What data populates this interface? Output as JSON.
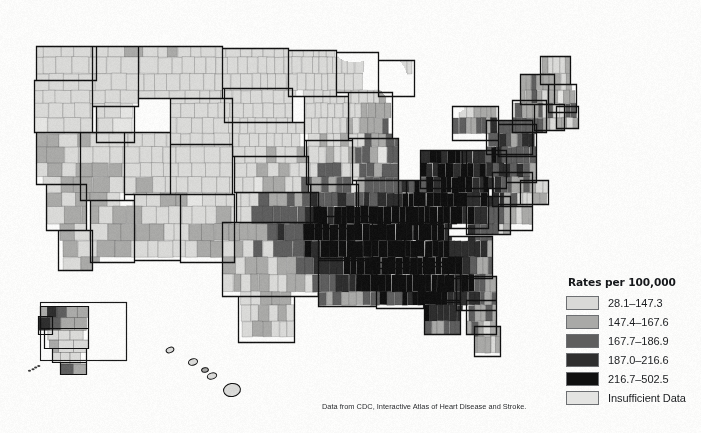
{
  "page": {
    "background_color": "#fbfbfa",
    "width": 701,
    "height": 433
  },
  "title": "Heart Disease Death Rate, 2016–2018",
  "source_note": "Data from CDC, Interactive Atlas of Heart Disease and Stroke.",
  "legend": {
    "title": "Rates per 100,000",
    "entries": [
      {
        "label": "28.1–147.3",
        "color": "#d9d9d7"
      },
      {
        "label": "147.4–167.6",
        "color": "#a9a9a7"
      },
      {
        "label": "167.7–186.9",
        "color": "#5e5e5e"
      },
      {
        "label": "187.0–216.6",
        "color": "#2e2e2e"
      },
      {
        "label": "216.7–502.5",
        "color": "#101010"
      },
      {
        "label": "Insufficient Data",
        "color": "#e4e4e2"
      }
    ]
  },
  "chart_data": {
    "type": "map",
    "subtype": "choropleth",
    "geography": "United States counties",
    "title": "Heart Disease Death Rate, 2016–2018",
    "measure": "Heart disease death rate",
    "unit": "deaths per 100,000 population",
    "period": "2016–2018",
    "source": "Data from CDC, Interactive Atlas of Heart Disease and Stroke.",
    "color_scheme": "grayscale sequential, light = low rate, dark = high rate",
    "legend_position": "bottom-right",
    "value_range": [
      28.1,
      502.5
    ],
    "classes": [
      {
        "label": "28.1–147.3",
        "min": 28.1,
        "max": 147.3,
        "color": "#d9d9d7"
      },
      {
        "label": "147.4–167.6",
        "min": 147.4,
        "max": 167.6,
        "color": "#a9a9a7"
      },
      {
        "label": "167.7–186.9",
        "min": 167.7,
        "max": 186.9,
        "color": "#5e5e5e"
      },
      {
        "label": "187.0–216.6",
        "min": 187.0,
        "max": 216.6,
        "color": "#2e2e2e"
      },
      {
        "label": "216.7–502.5",
        "min": 216.7,
        "max": 502.5,
        "color": "#101010"
      },
      {
        "label": "Insufficient Data",
        "min": null,
        "max": null,
        "color": "#e4e4e2"
      }
    ],
    "insets": [
      "Alaska",
      "Hawaii"
    ],
    "regional_pattern": [
      {
        "region": "Southeast (Mississippi, Alabama, Louisiana, Arkansas, Tennessee, Kentucky, Georgia)",
        "typical_class": "216.7–502.5",
        "description": "highest rates, dense dark shading"
      },
      {
        "region": "Oklahoma and East Texas",
        "typical_class": "216.7–502.5",
        "description": "high rates"
      },
      {
        "region": "Appalachia (West Virginia, eastern Kentucky, southern Ohio)",
        "typical_class": "187.0–216.6",
        "description": "elevated rates"
      },
      {
        "region": "Ohio Valley and lower Midwest",
        "typical_class": "187.0–216.6",
        "description": "moderately high rates"
      },
      {
        "region": "Northern Plains (North Dakota, South Dakota, Nebraska, Minnesota, Iowa)",
        "typical_class": "28.1–147.3",
        "description": "lowest rates, light shading"
      },
      {
        "region": "Mountain West (Montana, Idaho, Wyoming, Utah, Colorado)",
        "typical_class": "28.1–147.3",
        "description": "low rates with scattered mid-range counties"
      },
      {
        "region": "Pacific Northwest and Northern California",
        "typical_class": "147.4–167.6",
        "description": "low to moderate rates"
      },
      {
        "region": "Southwest (Arizona, New Mexico, Nevada)",
        "typical_class": "147.4–167.6",
        "description": "mixed low to moderate rates"
      },
      {
        "region": "Northeast (New England, New York, Pennsylvania)",
        "typical_class": "167.7–186.9",
        "description": "moderate rates, denser small counties"
      },
      {
        "region": "Florida",
        "typical_class": "167.7–186.9",
        "description": "moderate rates"
      },
      {
        "region": "Alaska",
        "typical_class": "147.4–167.6",
        "description": "mixed, several boroughs insufficient data"
      },
      {
        "region": "Hawaii",
        "typical_class": "28.1–147.3",
        "description": "low rates"
      }
    ]
  }
}
